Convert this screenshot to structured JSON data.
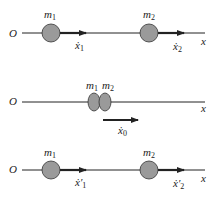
{
  "colors": {
    "line": "#222222",
    "ball_fill": "#9a9a9a",
    "ball_stroke": "#333333"
  },
  "panels": [
    {
      "id": "before",
      "origin": "O",
      "axis": "x",
      "masses": [
        {
          "name": "m",
          "sub": "1",
          "velocity": "ẋ",
          "velocity_sub": "1"
        },
        {
          "name": "m",
          "sub": "2",
          "velocity": "ẋ",
          "velocity_sub": "2"
        }
      ]
    },
    {
      "id": "collision",
      "origin": "O",
      "axis": "x",
      "masses": [
        {
          "name": "m",
          "sub": "1"
        },
        {
          "name": "m",
          "sub": "2"
        }
      ],
      "velocity": "ẋ",
      "velocity_sub": "0"
    },
    {
      "id": "after",
      "origin": "O",
      "axis": "x",
      "masses": [
        {
          "name": "m",
          "sub": "1",
          "velocity": "ẋ′",
          "velocity_sub": "1"
        },
        {
          "name": "m",
          "sub": "2",
          "velocity": "ẋ′",
          "velocity_sub": "2"
        }
      ]
    }
  ]
}
